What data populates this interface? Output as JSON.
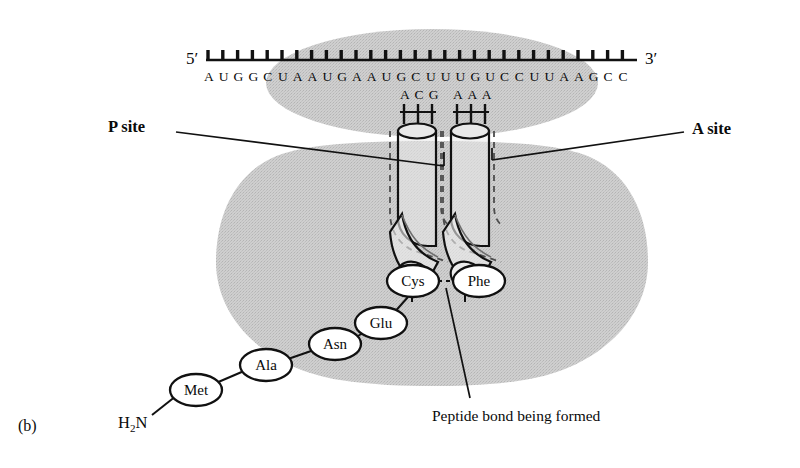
{
  "figure": {
    "panel_label": "(b)",
    "background_color": "#ffffff",
    "ribosome_color": "#c9c9c9",
    "stroke_color": "#111111"
  },
  "mrna": {
    "five_prime_label": "5′",
    "three_prime_label": "3′",
    "sequence": "AUGGCUAAUGAAUGCUUUGUCCUUAAGCC",
    "bases": [
      "A",
      "U",
      "G",
      "G",
      "C",
      "U",
      "A",
      "A",
      "U",
      "G",
      "A",
      "A",
      "U",
      "G",
      "C",
      "U",
      "U",
      "U",
      "G",
      "U",
      "C",
      "C",
      "U",
      "U",
      "A",
      "A",
      "G",
      "C",
      "C"
    ],
    "tick_count": 29
  },
  "trna": {
    "p_site": {
      "label": "P site",
      "anticodon": "ACG",
      "anticodon_bases": [
        "A",
        "C",
        "G"
      ],
      "amino_acid": "Cys"
    },
    "a_site": {
      "label": "A site",
      "anticodon": "AAA",
      "anticodon_bases": [
        "A",
        "A",
        "A"
      ],
      "amino_acid": "Phe"
    }
  },
  "polypeptide": {
    "n_terminus": "H",
    "n_terminus_sub": "2",
    "n_terminus_tail": "N",
    "residues": [
      {
        "name": "Met"
      },
      {
        "name": "Ala"
      },
      {
        "name": "Asn"
      },
      {
        "name": "Glu"
      },
      {
        "name": "Cys"
      },
      {
        "name": "Phe"
      }
    ]
  },
  "annotations": {
    "peptide_bond": "Peptide bond being formed"
  }
}
